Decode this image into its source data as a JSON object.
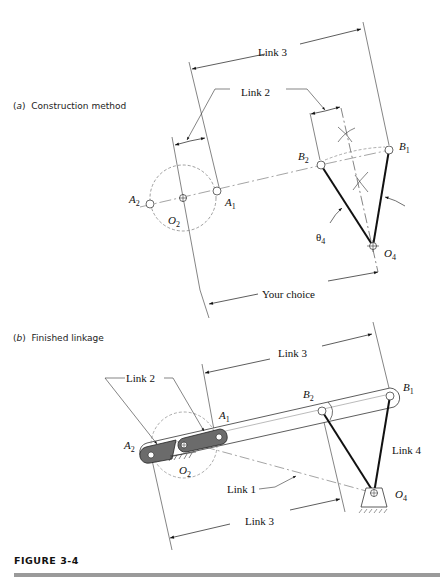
{
  "captions": {
    "a": "(a) Construction method",
    "a_letter": "a",
    "a_text": "Construction method",
    "b_letter": "b",
    "b_text": "Finished linkage"
  },
  "figure": {
    "label": "FIGURE 3-4",
    "rule_color": "#9a9a9a"
  },
  "part_a": {
    "labels": {
      "link3": "Link 3",
      "link2": "Link 2",
      "your_choice": "Your choice",
      "theta4": "θ",
      "theta4_sub": "4"
    },
    "points": {
      "A2": {
        "name": "A",
        "sub": "2",
        "x": 150,
        "y": 204
      },
      "O2": {
        "name": "O",
        "sub": "2",
        "x": 183,
        "y": 198
      },
      "A1": {
        "name": "A",
        "sub": "1",
        "x": 217,
        "y": 191
      },
      "B2": {
        "name": "B",
        "sub": "2",
        "x": 321,
        "y": 165
      },
      "B1": {
        "name": "B",
        "sub": "1",
        "x": 389,
        "y": 150
      },
      "O4": {
        "name": "O",
        "sub": "4",
        "x": 373,
        "y": 246
      }
    },
    "circle_radius": 33
  },
  "part_b": {
    "labels": {
      "link3_top": "Link 3",
      "link2": "Link 2",
      "link4": "Link 4",
      "link1": "Link 1",
      "link3_bottom": "Link 3"
    },
    "points": {
      "A2": {
        "name": "A",
        "sub": "2",
        "x": 151,
        "y": 451
      },
      "O2": {
        "name": "O",
        "sub": "2",
        "x": 184,
        "y": 445
      },
      "A1": {
        "name": "A",
        "sub": "1",
        "x": 219,
        "y": 436
      },
      "B2": {
        "name": "B",
        "sub": "2",
        "x": 322,
        "y": 411
      },
      "B1": {
        "name": "B",
        "sub": "1",
        "x": 390,
        "y": 396
      },
      "O4": {
        "name": "O",
        "sub": "4",
        "x": 374,
        "y": 493
      }
    },
    "link2_color": "#6b6b6b"
  }
}
